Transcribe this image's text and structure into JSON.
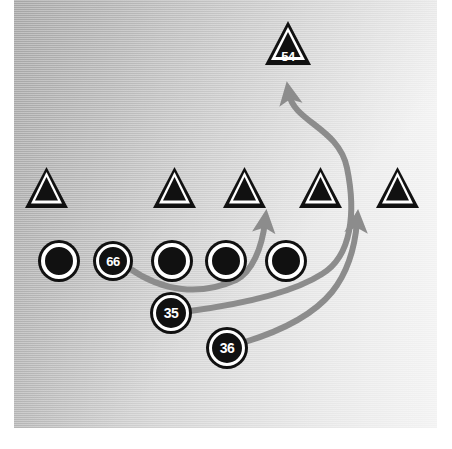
{
  "diagram": {
    "background": {
      "color_left": "#b9b9b9",
      "color_right": "#f2f2f2",
      "margin_color": "#ffffff"
    },
    "marker_colors": {
      "fill": "#111111",
      "ring": "#ffffff",
      "text": "#ffffff",
      "arrow": "#8c8c8c"
    },
    "defense_line": {
      "shape": "triangle",
      "label": "",
      "players": [
        {
          "name": "defender-1",
          "label": "",
          "cx": 46,
          "cy": 188,
          "size": 44
        },
        {
          "name": "defender-2",
          "label": "",
          "cx": 174,
          "cy": 188,
          "size": 44
        },
        {
          "name": "defender-3",
          "label": "",
          "cx": 244,
          "cy": 188,
          "size": 44
        },
        {
          "name": "defender-4",
          "label": "",
          "cx": 320,
          "cy": 188,
          "size": 44
        },
        {
          "name": "defender-5",
          "label": "",
          "cx": 397,
          "cy": 188,
          "size": 44
        }
      ]
    },
    "linebacker": {
      "name": "linebacker-54",
      "shape": "triangle",
      "label": "54",
      "cx": 287,
      "cy": 43,
      "size": 46
    },
    "offense_line": {
      "shape": "circle",
      "players": [
        {
          "name": "lineman-1",
          "label": "",
          "cx": 59,
          "cy": 261,
          "size": 36
        },
        {
          "name": "lineman-66",
          "label": "66",
          "cx": 113,
          "cy": 261,
          "size": 34
        },
        {
          "name": "lineman-3",
          "label": "",
          "cx": 172,
          "cy": 261,
          "size": 36
        },
        {
          "name": "lineman-4",
          "label": "",
          "cx": 226,
          "cy": 261,
          "size": 36
        },
        {
          "name": "lineman-5",
          "label": "",
          "cx": 286,
          "cy": 261,
          "size": 36
        }
      ]
    },
    "backfield": [
      {
        "name": "back-35",
        "shape": "circle",
        "label": "35",
        "cx": 171,
        "cy": 313,
        "size": 36
      },
      {
        "name": "back-36",
        "shape": "circle",
        "label": "36",
        "cx": 227,
        "cy": 348,
        "size": 36
      }
    ],
    "routes": [
      {
        "name": "route-66-block",
        "from": "66",
        "to": "gap-between-defender-3",
        "color": "#8c8c8c",
        "width": 6,
        "path": "M 129 268 C 163 292, 200 296, 236 280 C 252 272, 260 248, 265 224",
        "arrowhead": {
          "x": 265,
          "y": 214,
          "angle": -8
        }
      },
      {
        "name": "route-35-to-54",
        "from": "35",
        "to": "54",
        "color": "#8c8c8c",
        "width": 6,
        "path": "M 190 311 C 240 303, 292 292, 322 276 C 352 260, 356 214, 347 168 C 338 126, 294 120, 289 96",
        "arrowhead": {
          "x": 287,
          "y": 85,
          "angle": -10
        }
      },
      {
        "name": "route-36-block",
        "from": "36",
        "to": "gap-between-defender-4-5",
        "color": "#8c8c8c",
        "width": 6,
        "path": "M 245 342 C 282 330, 312 314, 330 292 C 346 272, 354 246, 357 224",
        "arrowhead": {
          "x": 358,
          "y": 214,
          "angle": 4
        }
      }
    ]
  }
}
